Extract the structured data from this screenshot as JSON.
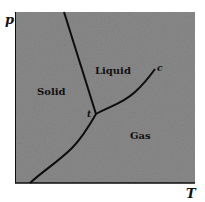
{
  "diagram": {
    "type": "phase-diagram",
    "axes": {
      "x_label": "T",
      "y_label": "p"
    },
    "regions": [
      {
        "id": "solid",
        "label": "Solid"
      },
      {
        "id": "liquid",
        "label": "Liquid"
      },
      {
        "id": "gas",
        "label": "Gas"
      }
    ],
    "points": [
      {
        "id": "triple",
        "label": "t"
      },
      {
        "id": "critical",
        "label": "c"
      }
    ],
    "curves": [
      {
        "id": "melting",
        "between": [
          "solid",
          "liquid"
        ],
        "from": "triple",
        "to": "top-edge"
      },
      {
        "id": "vaporization",
        "between": [
          "liquid",
          "gas"
        ],
        "from": "triple",
        "to": "critical"
      },
      {
        "id": "sublimation",
        "between": [
          "solid",
          "gas"
        ],
        "from": "bottom-edge",
        "to": "triple"
      }
    ],
    "colors": {
      "background": "#8a8a8a",
      "line": "#0d0d0d",
      "text": "#111111",
      "page": "#ffffff"
    }
  }
}
